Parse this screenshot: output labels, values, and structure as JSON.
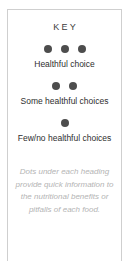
{
  "card": {
    "title": "KEY",
    "border_color": "#cfcfcf",
    "background_color": "#ffffff"
  },
  "legend": {
    "dot_color": "#4d4d4d",
    "items": [
      {
        "dot_count": 3,
        "label": "Healthful choice"
      },
      {
        "dot_count": 2,
        "label": "Some healthful choices"
      },
      {
        "dot_count": 1,
        "label": "Few/no healthful choices"
      }
    ]
  },
  "footnote": {
    "text": "Dots under each heading provide quick information to the nutritional benefits or pitfalls of each food.",
    "color": "#b4b4b4",
    "lines": [
      "Dots under each heading",
      "provide quick information to",
      "the nutritional benefits or",
      "pitfalls of each food."
    ]
  }
}
